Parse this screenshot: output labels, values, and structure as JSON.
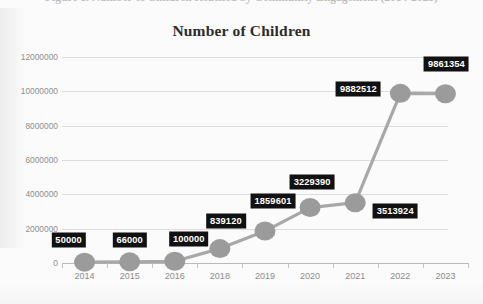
{
  "figure": {
    "caption": "Figure 1. Number of Children Reached by Community Engagement (2014-2023)"
  },
  "chart_data": {
    "type": "line",
    "title": "Number of Children",
    "xlabel": "",
    "ylabel": "",
    "categories": [
      "2014",
      "2015",
      "2016",
      "2018",
      "2019",
      "2020",
      "2021",
      "2022",
      "2023"
    ],
    "values": [
      50000,
      66000,
      100000,
      839120,
      1859601,
      3229390,
      3513924,
      9882512,
      9861354
    ],
    "data_labels": [
      "50000",
      "66000",
      "100000",
      "839120",
      "1859601",
      "3229390",
      "3513924",
      "9882512",
      "9861354"
    ],
    "ylim": [
      0,
      12000000
    ],
    "ytick_labels": [
      "0",
      "2000000",
      "4000000",
      "6000000",
      "8000000",
      "10000000",
      "12000000"
    ],
    "ytick_values": [
      0,
      2000000,
      4000000,
      6000000,
      8000000,
      10000000,
      12000000
    ],
    "grid": true,
    "legend": false,
    "series": [
      {
        "name": "Number of Children",
        "values": [
          50000,
          66000,
          100000,
          839120,
          1859601,
          3229390,
          3513924,
          9882512,
          9861354
        ]
      }
    ],
    "colors": {
      "line": "#a8a8a8",
      "marker": "#9b9b9b",
      "label_background": "#111111",
      "label_text": "#ffffff",
      "gridline": "#dcdcdc",
      "axis": "#b9b9b9",
      "tick_text": "#8e8e8e",
      "title_text": "#2b2b2b",
      "plot_background": "#fbfbfb"
    }
  }
}
